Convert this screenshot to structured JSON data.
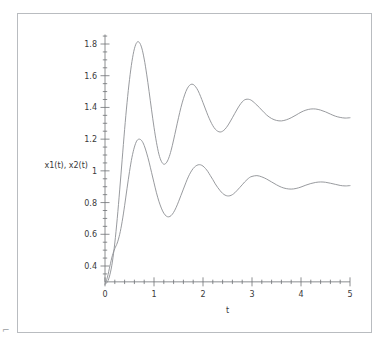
{
  "figure": {
    "background_color": "#ffffff",
    "frame_color": "#b9bcc0",
    "curve_color": "#8c8f93",
    "axis_color": "#6e7175",
    "text_color": "#3a3a3a",
    "corner_mark": "⌐"
  },
  "chart_data": {
    "type": "line",
    "title": "",
    "xlabel": "t",
    "ylabel": "x1(t), x2(t)",
    "xlim": [
      0,
      5
    ],
    "ylim": [
      0.28,
      1.86
    ],
    "grid": false,
    "legend_position": "none",
    "x_ticks": [
      "0",
      "1",
      "2",
      "3",
      "4",
      "5"
    ],
    "x_tick_values": [
      0,
      1,
      2,
      3,
      4,
      5
    ],
    "x_minor_tick_step": 0.2,
    "y_ticks": [
      "0.4",
      "0.6",
      "0.8",
      "1",
      "1.2",
      "1.4",
      "1.6",
      "1.8"
    ],
    "y_tick_values": [
      0.4,
      0.6,
      0.8,
      1.0,
      1.2,
      1.4,
      1.6,
      1.8
    ],
    "y_minor_tick_step": 0.05,
    "series": [
      {
        "name": "x1(t)",
        "steady_state": 1.35,
        "x": [
          0.0,
          0.05,
          0.1,
          0.15,
          0.2,
          0.25,
          0.3,
          0.35,
          0.4,
          0.45,
          0.5,
          0.55,
          0.6,
          0.65,
          0.7,
          0.75,
          0.8,
          0.85,
          0.9,
          0.95,
          1.0,
          1.05,
          1.1,
          1.15,
          1.2,
          1.25,
          1.3,
          1.35,
          1.4,
          1.45,
          1.5,
          1.55,
          1.6,
          1.65,
          1.7,
          1.75,
          1.8,
          1.85,
          1.9,
          1.95,
          2.0,
          2.05,
          2.1,
          2.15,
          2.2,
          2.25,
          2.3,
          2.35,
          2.4,
          2.45,
          2.5,
          2.55,
          2.6,
          2.65,
          2.7,
          2.75,
          2.8,
          2.85,
          2.9,
          2.95,
          3.0,
          3.1,
          3.2,
          3.3,
          3.4,
          3.5,
          3.6,
          3.7,
          3.8,
          3.9,
          4.0,
          4.1,
          4.2,
          4.3,
          4.4,
          4.5,
          4.6,
          4.7,
          4.8,
          4.9,
          5.0
        ],
        "y": [
          0.285,
          0.3,
          0.345,
          0.425,
          0.545,
          0.7,
          0.88,
          1.07,
          1.26,
          1.43,
          1.575,
          1.69,
          1.77,
          1.81,
          1.81,
          1.775,
          1.705,
          1.61,
          1.5,
          1.385,
          1.275,
          1.18,
          1.105,
          1.06,
          1.042,
          1.05,
          1.08,
          1.13,
          1.195,
          1.265,
          1.335,
          1.4,
          1.455,
          1.5,
          1.53,
          1.545,
          1.545,
          1.53,
          1.505,
          1.47,
          1.43,
          1.39,
          1.35,
          1.315,
          1.285,
          1.263,
          1.25,
          1.245,
          1.25,
          1.263,
          1.283,
          1.308,
          1.335,
          1.363,
          1.39,
          1.415,
          1.435,
          1.448,
          1.452,
          1.45,
          1.442,
          1.415,
          1.383,
          1.352,
          1.33,
          1.318,
          1.315,
          1.322,
          1.335,
          1.352,
          1.37,
          1.383,
          1.39,
          1.39,
          1.383,
          1.372,
          1.358,
          1.345,
          1.337,
          1.333,
          1.335
        ]
      },
      {
        "name": "x2(t)",
        "steady_state": 0.91,
        "x": [
          0.0,
          0.05,
          0.1,
          0.15,
          0.2,
          0.25,
          0.3,
          0.35,
          0.4,
          0.45,
          0.5,
          0.55,
          0.6,
          0.65,
          0.7,
          0.75,
          0.8,
          0.85,
          0.9,
          0.95,
          1.0,
          1.05,
          1.1,
          1.15,
          1.2,
          1.25,
          1.3,
          1.35,
          1.4,
          1.45,
          1.5,
          1.55,
          1.6,
          1.65,
          1.7,
          1.75,
          1.8,
          1.85,
          1.9,
          1.95,
          2.0,
          2.05,
          2.1,
          2.15,
          2.2,
          2.25,
          2.3,
          2.35,
          2.4,
          2.45,
          2.5,
          2.55,
          2.6,
          2.65,
          2.7,
          2.75,
          2.8,
          2.85,
          2.9,
          2.95,
          3.0,
          3.1,
          3.2,
          3.3,
          3.4,
          3.5,
          3.6,
          3.7,
          3.8,
          3.9,
          4.0,
          4.1,
          4.2,
          4.3,
          4.4,
          4.5,
          4.6,
          4.7,
          4.8,
          4.9,
          5.0
        ],
        "y": [
          0.285,
          0.33,
          0.4,
          0.465,
          0.51,
          0.545,
          0.6,
          0.68,
          0.78,
          0.89,
          0.995,
          1.085,
          1.15,
          1.19,
          1.2,
          1.19,
          1.16,
          1.112,
          1.055,
          0.99,
          0.925,
          0.862,
          0.808,
          0.765,
          0.733,
          0.715,
          0.71,
          0.718,
          0.738,
          0.768,
          0.805,
          0.845,
          0.885,
          0.925,
          0.962,
          0.992,
          1.015,
          1.03,
          1.038,
          1.038,
          1.03,
          1.015,
          0.995,
          0.97,
          0.945,
          0.918,
          0.895,
          0.875,
          0.858,
          0.847,
          0.842,
          0.843,
          0.85,
          0.862,
          0.878,
          0.895,
          0.912,
          0.93,
          0.945,
          0.958,
          0.965,
          0.97,
          0.962,
          0.948,
          0.93,
          0.912,
          0.897,
          0.888,
          0.885,
          0.889,
          0.898,
          0.91,
          0.92,
          0.927,
          0.93,
          0.928,
          0.922,
          0.915,
          0.908,
          0.905,
          0.907
        ]
      }
    ]
  }
}
